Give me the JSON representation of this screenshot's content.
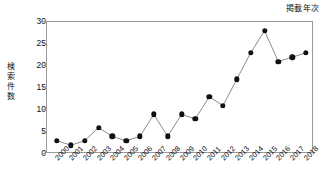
{
  "chart_data": {
    "type": "line",
    "title": "",
    "corner_label": "掲載年次",
    "xlabel": "掲載年次",
    "ylabel": "検索件数",
    "ylabel_chars": [
      "検",
      "索",
      "件",
      "数"
    ],
    "categories": [
      "2000",
      "2001",
      "2002",
      "2003",
      "2004",
      "2005",
      "2006",
      "2007",
      "2008",
      "2009",
      "2010",
      "2011",
      "2012",
      "2013",
      "2014",
      "2015",
      "2016",
      "2017",
      "2018"
    ],
    "values": [
      3,
      2,
      3,
      6,
      4,
      3,
      4,
      9,
      4,
      9,
      8,
      13,
      11,
      17,
      23,
      28,
      21,
      22,
      23
    ],
    "ylim": [
      0,
      30
    ],
    "yticks": [
      0,
      5,
      10,
      15,
      20,
      25,
      30
    ],
    "grid": false,
    "legend": "none",
    "marker": "filled-circle",
    "line_color": "#8c8c8c",
    "marker_color": "#111111",
    "frame_color": "#9a9a9a",
    "background": "#ffffff"
  }
}
